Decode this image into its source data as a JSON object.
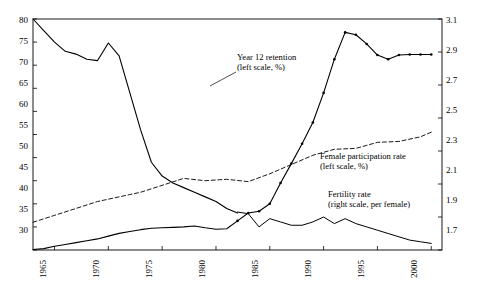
{
  "chart_data": {
    "type": "line",
    "title": "",
    "xlabel": "",
    "ylabel": "",
    "xlim": [
      1963,
      2001
    ],
    "left_axis": {
      "label": "left scale, %",
      "ylim": [
        30,
        80
      ],
      "ticks": [
        "30",
        "35",
        "40",
        "45",
        "50",
        "55",
        "60",
        "65",
        "70",
        "75",
        "80"
      ]
    },
    "right_axis": {
      "label": "right scale, per female",
      "ylim": [
        1.7,
        3.1
      ],
      "ticks": [
        "1.7",
        "1.9",
        "2.1",
        "2.3",
        "2.5",
        "2.7",
        "2.9",
        "3.1"
      ]
    },
    "xticks": [
      "1965",
      "1970",
      "1975",
      "1980",
      "1985",
      "1990",
      "1995",
      "2000"
    ],
    "grid": false,
    "legend_position": "inline-annotations",
    "annotations": [
      {
        "name": "year12-label",
        "text_line1": "Year 12 retention",
        "text_line2": "(left scale, %)"
      },
      {
        "name": "female-participation-label",
        "text_line1": "Female participation rate",
        "text_line2": "(left scale, %)"
      },
      {
        "name": "fertility-label",
        "text_line1": "Fertility rate",
        "text_line2": "(right scale, per female)"
      }
    ],
    "series": [
      {
        "name": "Year 12 retention",
        "axis": "left",
        "style": "solid",
        "unit": "%",
        "x": [
          1963,
          1964,
          1965,
          1966,
          1967,
          1968,
          1969,
          1970,
          1971,
          1972,
          1973,
          1974,
          1975,
          1976,
          1977,
          1978,
          1979,
          1980,
          1981,
          1982,
          1983,
          1984,
          1985,
          1986,
          1987,
          1988,
          1989,
          1990,
          1991,
          1992,
          1993,
          1994,
          1995,
          1996,
          1997,
          1998,
          1999,
          2000
        ],
        "y": [
          30.1,
          30.3,
          30.8,
          31.2,
          31.6,
          32.0,
          32.4,
          33.0,
          33.6,
          34.0,
          34.4,
          34.7,
          34.8,
          34.9,
          35.0,
          35.2,
          34.8,
          34.5,
          34.6,
          36.3,
          38.0,
          38.4,
          40.0,
          44.5,
          48.7,
          53.0,
          57.6,
          64.0,
          71.3,
          77.1,
          76.6,
          74.6,
          72.2,
          71.3,
          72.2,
          72.3,
          72.3,
          72.3
        ]
      },
      {
        "name": "Year 12 retention (descending early segment)",
        "axis": "left",
        "style": "solid-descending",
        "unit": "%",
        "x": [
          1963,
          1964,
          1965,
          1966,
          1967,
          1968,
          1969,
          1970,
          1971,
          1972,
          1973,
          1974,
          1975,
          1976,
          1977,
          1978,
          1979,
          1980,
          1981,
          1982
        ],
        "y": [
          80.0,
          77.5,
          75.0,
          73.0,
          72.4,
          71.3,
          71.0,
          74.8,
          72.0,
          64.0,
          56.0,
          49.0,
          46.0,
          44.5,
          43.5,
          42.5,
          41.5,
          40.5,
          39.0,
          38.0
        ]
      },
      {
        "name": "Female participation rate",
        "axis": "left",
        "style": "dashed",
        "unit": "%",
        "x": [
          1963,
          1965,
          1967,
          1969,
          1971,
          1973,
          1975,
          1977,
          1979,
          1981,
          1983,
          1985,
          1987,
          1989,
          1991,
          1993,
          1995,
          1997,
          1999,
          2000
        ],
        "y": [
          36.0,
          37.5,
          39.0,
          40.5,
          41.5,
          42.5,
          44.0,
          45.5,
          45.0,
          45.3,
          44.8,
          46.5,
          48.5,
          50.5,
          51.8,
          52.0,
          53.3,
          53.5,
          54.5,
          55.5
        ]
      },
      {
        "name": "Fertility rate",
        "axis": "right",
        "style": "solid-thin",
        "unit": "per female",
        "x": [
          1982,
          1983,
          1984,
          1985,
          1986,
          1987,
          1988,
          1989,
          1990,
          1991,
          1992,
          1993,
          1994,
          1995,
          1996,
          1997,
          1998,
          1999,
          2000
        ],
        "y": [
          1.93,
          1.92,
          1.84,
          1.89,
          1.87,
          1.85,
          1.85,
          1.87,
          1.9,
          1.86,
          1.89,
          1.86,
          1.84,
          1.82,
          1.8,
          1.78,
          1.76,
          1.75,
          1.74
        ]
      }
    ]
  },
  "axes": {
    "left_ticks": [
      "80",
      "75",
      "70",
      "65",
      "60",
      "55",
      "50",
      "45",
      "40",
      "35",
      "30"
    ],
    "right_ticks": [
      "3.1",
      "2.9",
      "2.7",
      "2.5",
      "2.3",
      "2.1",
      "1.9",
      "1.7"
    ],
    "x_ticks": [
      "1965",
      "1970",
      "1975",
      "1980",
      "1985",
      "1990",
      "1995",
      "2000"
    ]
  }
}
